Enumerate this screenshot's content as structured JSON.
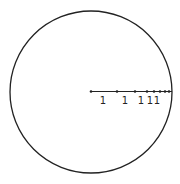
{
  "diagram": {
    "circle": {
      "cx": 91,
      "cy": 92,
      "r": 81,
      "stroke": "#222222"
    },
    "radius_line": {
      "x1": 91,
      "y1": 91.5,
      "x2": 172,
      "y2": 91.5,
      "stroke": "#222222"
    },
    "points": [
      {
        "x": 91
      },
      {
        "x": 117
      },
      {
        "x": 135
      },
      {
        "x": 147
      },
      {
        "x": 154
      },
      {
        "x": 160
      },
      {
        "x": 165
      },
      {
        "x": 169
      }
    ],
    "labels": [
      {
        "text": "1",
        "x": 103,
        "y": 104
      },
      {
        "text": "1",
        "x": 125,
        "y": 104
      },
      {
        "text": "1",
        "x": 141,
        "y": 104
      },
      {
        "text": "1",
        "x": 150,
        "y": 104
      },
      {
        "text": "1",
        "x": 157,
        "y": 104
      }
    ]
  }
}
